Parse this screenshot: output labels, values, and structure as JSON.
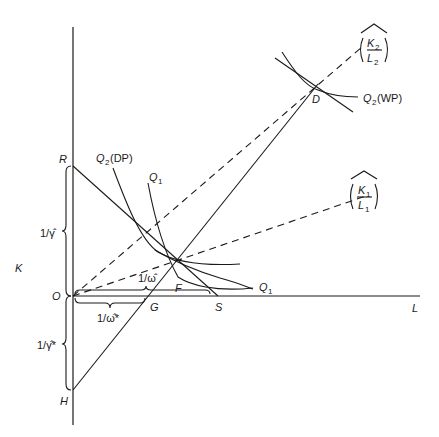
{
  "diagram": {
    "axes": {
      "vertical_label": "K",
      "horizontal_label": "L",
      "origin_label": "O"
    },
    "points": {
      "R": "R",
      "H": "H",
      "S": "S",
      "G": "G",
      "F": "F",
      "D": "D"
    },
    "curves": {
      "q2_dp": {
        "main": "Q",
        "sub": "2",
        "suffix": "(DP)"
      },
      "q1_top": {
        "main": "Q",
        "sub": "1"
      },
      "q1_right": {
        "main": "Q",
        "sub": "1"
      },
      "q2_wp": {
        "main": "Q",
        "sub": "2",
        "suffix": "(WP)"
      }
    },
    "rays": {
      "k2_l2": {
        "num": "K",
        "num_sub": "2",
        "den": "L",
        "den_sub": "2"
      },
      "k1_l1": {
        "num": "K",
        "num_sub": "1",
        "den": "L",
        "den_sub": "1"
      }
    },
    "braces": {
      "gamma": "1/γ̂",
      "gamma_star": "1/γ̂*",
      "omega": "1/ω̂",
      "omega_star": "1/ω̂*"
    }
  }
}
